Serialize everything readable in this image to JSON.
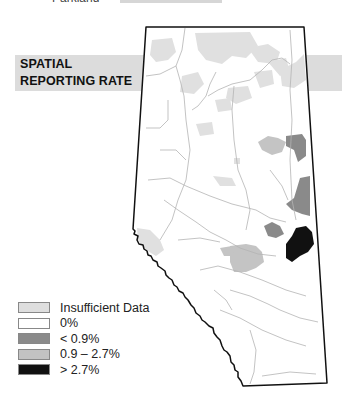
{
  "header": {
    "top_label": "Parkland"
  },
  "title": {
    "line1": "SPATIAL",
    "line2": "REPORTING RATE"
  },
  "map": {
    "region": "Alberta",
    "colors": {
      "insufficient": "#dedede",
      "zero": "#ffffff",
      "low": "#8a8a8a",
      "mid": "#c2c2c2",
      "high": "#111111",
      "border": "#111111",
      "river": "#b4b4b4"
    }
  },
  "legend": {
    "items": [
      {
        "label": "Insufficient Data",
        "color": "#dedede"
      },
      {
        "label": "0%",
        "color": "#ffffff"
      },
      {
        "label": "< 0.9%",
        "color": "#8a8a8a"
      },
      {
        "label": "0.9 – 2.7%",
        "color": "#c2c2c2"
      },
      {
        "label": "> 2.7%",
        "color": "#111111"
      }
    ]
  }
}
